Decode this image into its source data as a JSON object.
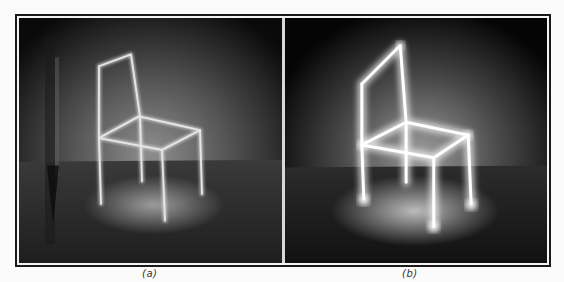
{
  "figure": {
    "panels": [
      {
        "id": "a",
        "label": "(a)",
        "subject": "chair outline traced with light (thin lines)",
        "glow_color": "#f2f2f2"
      },
      {
        "id": "b",
        "label": "(b)",
        "subject": "chair outline traced with light (thick glowing lines)",
        "glow_color": "#ffffff"
      }
    ]
  }
}
